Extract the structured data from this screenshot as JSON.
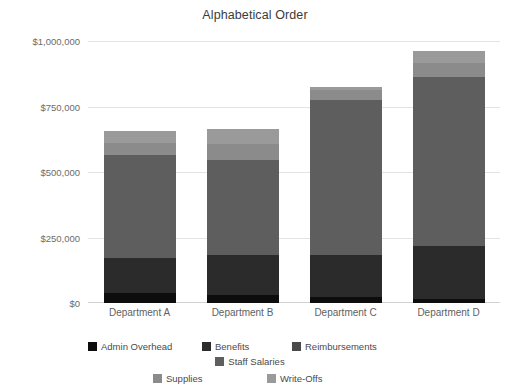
{
  "chart_data": {
    "type": "bar",
    "subtype": "stacked-bar",
    "title": "Alphabetical Order",
    "xlabel": "",
    "ylabel": "",
    "categories": [
      "Department A",
      "Department B",
      "Department C",
      "Department D"
    ],
    "ylim": [
      0,
      1000000
    ],
    "ytick_values": [
      0,
      250000,
      500000,
      750000,
      1000000
    ],
    "ytick_labels": [
      "$0",
      "$250,000",
      "$500,000",
      "$750,000",
      "$1,000,000"
    ],
    "grid": true,
    "legend_position": "bottom",
    "series": [
      {
        "name": "Admin Overhead",
        "color": "#0d0d0d",
        "values": [
          38000,
          30000,
          23000,
          15000
        ]
      },
      {
        "name": "Benefits",
        "color": "#2b2b2b",
        "values": [
          133000,
          153000,
          160000,
          202000
        ]
      },
      {
        "name": "Reimbursements",
        "color": "#4a4a4a",
        "values": [
          0,
          0,
          0,
          0
        ]
      },
      {
        "name": "Staff Salaries",
        "color": "#5e5e5e",
        "values": [
          393000,
          363000,
          592000,
          645000
        ]
      },
      {
        "name": "Supplies",
        "color": "#8b8b8b",
        "values": [
          46000,
          61000,
          38000,
          53000
        ]
      },
      {
        "name": "Write-Offs",
        "color": "#9a9a9a",
        "values": [
          46000,
          56000,
          10000,
          47000
        ]
      }
    ],
    "totals": [
      656000,
      663000,
      823000,
      962000
    ],
    "legend_entries": [
      "Admin Overhead",
      "Benefits",
      "Reimbursements",
      "Staff Salaries",
      "Supplies",
      "Write-Offs"
    ]
  }
}
